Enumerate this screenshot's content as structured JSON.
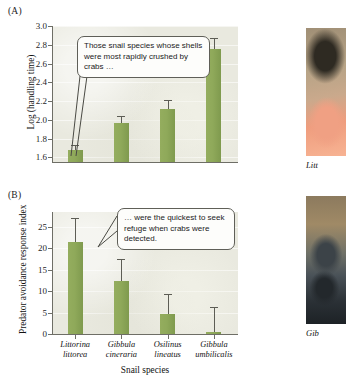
{
  "figure": {
    "panel_a_label": "(A)",
    "panel_b_label": "(B)",
    "xlabel": "Snail species"
  },
  "callouts": {
    "a": "Those snail species whose shells were most rapidly crushed by crabs …",
    "b": "… were the quickest to seek refuge when crabs were detected."
  },
  "photos": {
    "top_caption": "Litt",
    "bottom_caption": "Gib",
    "top_alt": "littorina-snail-photo",
    "bottom_alt": "gibbula-snail-photo"
  },
  "species": [
    {
      "genus": "Littorina",
      "epithet": "littorea"
    },
    {
      "genus": "Gibbula",
      "epithet": "cineraria"
    },
    {
      "genus": "Osilinus",
      "epithet": "lineatus"
    },
    {
      "genus": "Gibbula",
      "epithet": "umbilicalis"
    }
  ],
  "chart_data": [
    {
      "type": "bar",
      "panel": "A",
      "title": "",
      "xlabel": "",
      "ylabel": "Log (handling time)",
      "categories": [
        "Littorina littorea",
        "Gibbula cineraria",
        "Osilinus lineatus",
        "Gibbula umbilicalis"
      ],
      "values": [
        1.68,
        1.97,
        2.12,
        2.76
      ],
      "errors_upper": [
        1.73,
        2.04,
        2.21,
        2.87
      ],
      "errors_lower": [
        1.68,
        1.97,
        2.12,
        2.76
      ],
      "yticks": [
        1.6,
        1.8,
        2.0,
        2.2,
        2.4,
        2.6,
        2.8,
        3.0
      ],
      "ytick_labels": [
        "1.6",
        "1.8",
        "2.0",
        "2.2",
        "2.4",
        "2.6",
        "2.8",
        "3.0"
      ],
      "ylim": [
        1.55,
        3.0
      ],
      "grid": true,
      "legend": "none",
      "bar_color": "#8fa95a",
      "plot_background": "#e9e9df"
    },
    {
      "type": "bar",
      "panel": "B",
      "title": "",
      "xlabel": "Snail species",
      "ylabel": "Predator avoidance response index",
      "categories": [
        "Littorina littorea",
        "Gibbula cineraria",
        "Osilinus lineatus",
        "Gibbula umbilicalis"
      ],
      "values": [
        21.4,
        12.4,
        4.7,
        0.4
      ],
      "errors_upper": [
        27.2,
        17.5,
        9.4,
        6.2
      ],
      "errors_lower": [
        21.4,
        12.4,
        4.7,
        0.4
      ],
      "yticks": [
        0,
        5,
        10,
        15,
        20,
        25
      ],
      "ytick_labels": [
        "0",
        "5",
        "10",
        "15",
        "20",
        "25"
      ],
      "ylim": [
        0,
        28.5
      ],
      "grid": true,
      "legend": "none",
      "bar_color": "#8fa95a",
      "plot_background": "#e9e9df"
    }
  ]
}
